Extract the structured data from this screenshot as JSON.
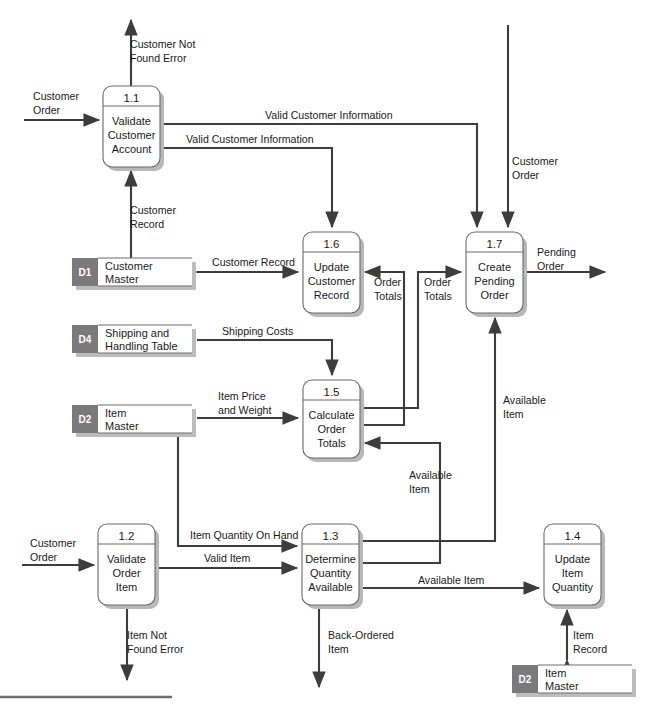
{
  "diagram": {
    "type": "data-flow-diagram",
    "colors": {
      "line": "#3d3d3d",
      "process_stroke": "#6b6b6b",
      "store_tab": "#7a7a7a",
      "shadow": "#b8b8b8",
      "background": "#ffffff"
    },
    "processes": [
      {
        "id": "1.1",
        "name_lines": [
          "Validate",
          "Customer",
          "Account"
        ],
        "x": 103,
        "y": 86,
        "w": 57,
        "h": 81
      },
      {
        "id": "1.2",
        "name_lines": [
          "Validate",
          "Order",
          "Item"
        ],
        "x": 98,
        "y": 524,
        "w": 57,
        "h": 81
      },
      {
        "id": "1.3",
        "name_lines": [
          "Determine",
          "Quantity",
          "Available"
        ],
        "x": 302,
        "y": 524,
        "w": 57,
        "h": 81
      },
      {
        "id": "1.4",
        "name_lines": [
          "Update",
          "Item",
          "Quantity"
        ],
        "x": 544,
        "y": 524,
        "w": 57,
        "h": 81
      },
      {
        "id": "1.5",
        "name_lines": [
          "Calculate",
          "Order",
          "Totals"
        ],
        "x": 303,
        "y": 380,
        "w": 57,
        "h": 78
      },
      {
        "id": "1.6",
        "name_lines": [
          "Update",
          "Customer",
          "Record"
        ],
        "x": 303,
        "y": 232,
        "w": 57,
        "h": 81
      },
      {
        "id": "1.7",
        "name_lines": [
          "Create",
          "Pending",
          "Order"
        ],
        "x": 466,
        "y": 232,
        "w": 57,
        "h": 81
      }
    ],
    "data_stores": [
      {
        "id": "D1",
        "name_lines": [
          "Customer",
          "Master"
        ],
        "x": 72,
        "y": 258,
        "w": 120,
        "h": 28
      },
      {
        "id": "D4",
        "name_lines": [
          "Shipping and",
          "Handling Table"
        ],
        "x": 72,
        "y": 325,
        "w": 120,
        "h": 28
      },
      {
        "id": "D2",
        "name_lines": [
          "Item",
          "Master"
        ],
        "x": 72,
        "y": 405,
        "w": 120,
        "h": 28
      },
      {
        "id": "D2",
        "name_lines": [
          "Item",
          "Master"
        ],
        "x": 512,
        "y": 665,
        "w": 120,
        "h": 28
      }
    ],
    "flow_labels": [
      {
        "text_lines": [
          "Customer",
          "Order"
        ],
        "x": 33,
        "y": 100,
        "anchor": "start",
        "name": "flow-label-customer-order-in-1-1"
      },
      {
        "text_lines": [
          "Customer Not",
          "Found Error"
        ],
        "x": 130,
        "y": 42,
        "anchor": "start",
        "name": "flow-label-customer-not-found-error"
      },
      {
        "text_lines": [
          "Valid Customer Information"
        ],
        "x": 265,
        "y": 117,
        "anchor": "start",
        "name": "flow-label-valid-customer-information-1-7"
      },
      {
        "text_lines": [
          "Valid Customer Information"
        ],
        "x": 186,
        "y": 141,
        "anchor": "start",
        "name": "flow-label-valid-customer-information-1-6"
      },
      {
        "text_lines": [
          "Customer",
          "Order"
        ],
        "x": 510,
        "y": 163,
        "anchor": "start",
        "name": "flow-label-customer-order-in-1-7"
      },
      {
        "text_lines": [
          "Customer",
          "Record"
        ],
        "x": 129,
        "y": 212,
        "anchor": "start",
        "name": "flow-label-customer-record-1-1"
      },
      {
        "text_lines": [
          "Customer Record"
        ],
        "x": 212,
        "y": 264,
        "anchor": "start",
        "name": "flow-label-customer-record-d1-1-6"
      },
      {
        "text_lines": [
          "Order",
          "Totals"
        ],
        "x": 375,
        "y": 284,
        "anchor": "start",
        "name": "flow-label-order-totals-1-6"
      },
      {
        "text_lines": [
          "Order",
          "Totals"
        ],
        "x": 425,
        "y": 284,
        "anchor": "start",
        "name": "flow-label-order-totals-1-7"
      },
      {
        "text_lines": [
          "Pending",
          "Order"
        ],
        "x": 538,
        "y": 254,
        "anchor": "start",
        "name": "flow-label-pending-order"
      },
      {
        "text_lines": [
          "Shipping Costs"
        ],
        "x": 222,
        "y": 333,
        "anchor": "start",
        "name": "flow-label-shipping-costs"
      },
      {
        "text_lines": [
          "Item Price",
          "and Weight"
        ],
        "x": 218,
        "y": 398,
        "anchor": "start",
        "name": "flow-label-item-price-and-weight"
      },
      {
        "text_lines": [
          "Available",
          "Item"
        ],
        "x": 410,
        "y": 477,
        "anchor": "start",
        "name": "flow-label-available-item-1-5"
      },
      {
        "text_lines": [
          "Available",
          "Item"
        ],
        "x": 503,
        "y": 402,
        "anchor": "start",
        "name": "flow-label-available-item-1-7"
      },
      {
        "text_lines": [
          "Customer",
          "Order"
        ],
        "x": 30,
        "y": 545,
        "anchor": "start",
        "name": "flow-label-customer-order-in-1-2"
      },
      {
        "text_lines": [
          "Item Quantity On Hand"
        ],
        "x": 190,
        "y": 537,
        "anchor": "start",
        "name": "flow-label-item-quantity-on-hand"
      },
      {
        "text_lines": [
          "Valid Item"
        ],
        "x": 204,
        "y": 560,
        "anchor": "start",
        "name": "flow-label-valid-item"
      },
      {
        "text_lines": [
          "Available Item"
        ],
        "x": 418,
        "y": 589,
        "anchor": "start",
        "name": "flow-label-available-item-1-4"
      },
      {
        "text_lines": [
          "Item Not",
          "Found Error"
        ],
        "x": 127,
        "y": 637,
        "anchor": "start",
        "name": "flow-label-item-not-found-error"
      },
      {
        "text_lines": [
          "Back-Ordered",
          "Item"
        ],
        "x": 328,
        "y": 637,
        "anchor": "start",
        "name": "flow-label-back-ordered-item"
      },
      {
        "text_lines": [
          "Item",
          "Record"
        ],
        "x": 573,
        "y": 637,
        "anchor": "start",
        "name": "flow-label-item-record"
      }
    ]
  }
}
